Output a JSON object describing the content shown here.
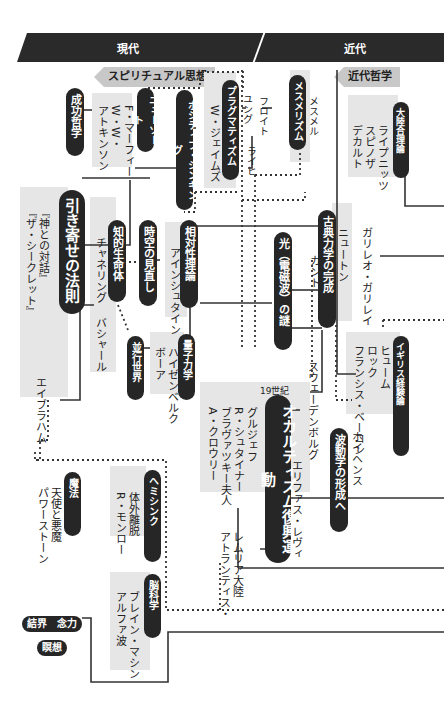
{
  "header": {
    "eras": [
      {
        "label": "現代"
      },
      {
        "label": "近代"
      }
    ]
  },
  "section_tags": {
    "spiritual": "スピリチュアル思想",
    "modern_philosophy": "近代哲学"
  },
  "nodes": {
    "success_philosophy": {
      "label": "成功哲学"
    },
    "new_thought": {
      "label": "ニューソート",
      "people": [
        "F・マーフィー",
        "W・W・",
        "アトキンソン"
      ]
    },
    "positive_thinking": {
      "label": "ポジティブ・シンキング"
    },
    "pragmatism": {
      "label": "プラグマティズム",
      "people": [
        "W・ジェイムズ"
      ]
    },
    "mesmerism": {
      "label": "メスメリズム",
      "people": [
        "メスメル"
      ]
    },
    "freud_line": {
      "people": [
        "フロイト",
        "ユング",
        "ライヒ"
      ]
    },
    "continental_rationalism": {
      "label": "大陸合理論",
      "people": [
        "デカルト",
        "スピノザ",
        "ライプニッツ"
      ]
    },
    "law_of_attraction": {
      "label": "引き寄せの法則",
      "works": [
        "『ザ・シークレット』",
        "『神との対話』"
      ],
      "people": [
        "エイブラハム"
      ]
    },
    "intelligent_life": {
      "label": "知的生命体",
      "people": [
        "チャネリング",
        "バシャール"
      ]
    },
    "spacetime": {
      "label": "時空の見直し"
    },
    "relativity": {
      "label": "相対性理論",
      "people": [
        "アインシュタイン"
      ]
    },
    "light_mystery": {
      "label": "光（電磁波）の謎"
    },
    "classical_mechanics": {
      "label": "古典力学の完成",
      "people": [
        "ニュートン"
      ]
    },
    "galileo": {
      "people": [
        "ガリレオ・ガリレイ"
      ]
    },
    "kant": {
      "people": [
        "カント"
      ]
    },
    "quantum": {
      "label": "量子力学",
      "people": [
        "ボーア",
        "ハイゼンベルク"
      ]
    },
    "parallel_worlds": {
      "label": "並行世界"
    },
    "british_empiricism": {
      "label": "イギリス経験論",
      "people": [
        "フランシス・ベーコン",
        "ロック",
        "ヒューム"
      ]
    },
    "occultism": {
      "label": "オカルティズム復興運動",
      "era_note": "19世紀",
      "people": [
        "A・クロウリー",
        "ブラヴァツキー夫人",
        "R・シュタイナー",
        "グルジェフ",
        "エリファス・レヴィ"
      ]
    },
    "swedenborg": {
      "people": [
        "スウェーデンボルグ"
      ]
    },
    "wave_mechanics": {
      "label": "波動学の形成へ",
      "people": [
        "ホイヘンス"
      ]
    },
    "atlantis": {
      "people": [
        "アトランティス・",
        "レムリア大陸"
      ]
    },
    "magic": {
      "label": "魔法",
      "people": [
        "パワーストーン",
        "天使と悪魔"
      ]
    },
    "hemi_sync": {
      "label": "ヘミシンク",
      "people": [
        "R・モンロー",
        "体外離脱"
      ]
    },
    "brain_science": {
      "label": "脳科学",
      "people": [
        "アルファ波",
        "ブレイン・マシン"
      ]
    },
    "barrier": {
      "label": "結界　念力"
    },
    "meditation": {
      "label": "瞑想"
    }
  },
  "colors": {
    "banner": "#2a2a2a",
    "pill": "#262626",
    "gray_block": "#e6e6e6",
    "tag": "#c8c8c8",
    "line": "#333333"
  }
}
